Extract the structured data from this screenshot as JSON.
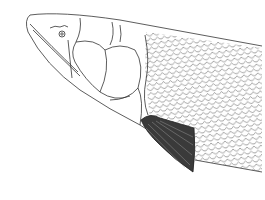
{
  "image": {
    "subject": "fish head line drawing",
    "width": 265,
    "height": 200,
    "colors": {
      "background": "#ffffff",
      "line": "#333333",
      "fin": "#2a2a2a"
    }
  }
}
